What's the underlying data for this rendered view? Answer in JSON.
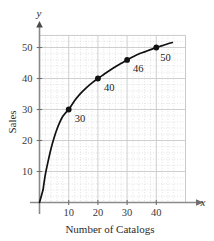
{
  "chart_data": {
    "type": "line",
    "title": "",
    "xlabel": "Number of Catalogs",
    "ylabel": "Sales",
    "x_axis_symbol": "x",
    "y_axis_symbol": "y",
    "xlim": [
      0,
      46
    ],
    "ylim": [
      0,
      54
    ],
    "xticks": [
      10,
      20,
      30,
      40
    ],
    "yticks": [
      10,
      20,
      30,
      40,
      50
    ],
    "xtick_labels": [
      "10",
      "20",
      "30",
      "40"
    ],
    "ytick_labels": [
      "10",
      "20",
      "30",
      "40",
      "50"
    ],
    "grid": true,
    "grid_major": true,
    "grid_minor": true,
    "minor_divisions": 5,
    "legend": "none",
    "series": [
      {
        "name": "Sales",
        "x": [
          10,
          20,
          30,
          40
        ],
        "y": [
          30,
          40,
          46,
          50
        ],
        "point_labels": [
          "30",
          "40",
          "46",
          "50"
        ],
        "marker": "filled-circle",
        "line_color": "#111111"
      }
    ],
    "curve_points": [
      {
        "x": 1.2,
        "y": 4.0
      },
      {
        "x": 2.0,
        "y": 9.0
      },
      {
        "x": 3.0,
        "y": 13.5
      },
      {
        "x": 4.0,
        "y": 17.6
      },
      {
        "x": 5.0,
        "y": 20.9
      },
      {
        "x": 6.0,
        "y": 23.7
      },
      {
        "x": 7.0,
        "y": 26.0
      },
      {
        "x": 8.0,
        "y": 27.8
      },
      {
        "x": 9.0,
        "y": 29.0
      },
      {
        "x": 10.0,
        "y": 30.0
      },
      {
        "x": 12.0,
        "y": 32.8
      },
      {
        "x": 14.0,
        "y": 35.1
      },
      {
        "x": 16.0,
        "y": 37.0
      },
      {
        "x": 18.0,
        "y": 38.6
      },
      {
        "x": 20.0,
        "y": 40.0
      },
      {
        "x": 22.0,
        "y": 41.3
      },
      {
        "x": 24.0,
        "y": 42.6
      },
      {
        "x": 26.0,
        "y": 43.8
      },
      {
        "x": 28.0,
        "y": 44.9
      },
      {
        "x": 30.0,
        "y": 46.0
      },
      {
        "x": 32.0,
        "y": 47.0
      },
      {
        "x": 34.0,
        "y": 47.9
      },
      {
        "x": 36.0,
        "y": 48.6
      },
      {
        "x": 38.0,
        "y": 49.3
      },
      {
        "x": 40.0,
        "y": 50.0
      },
      {
        "x": 42.0,
        "y": 50.6
      },
      {
        "x": 44.0,
        "y": 51.2
      },
      {
        "x": 45.5,
        "y": 51.6
      }
    ],
    "colors": {
      "curve": "#111111",
      "marker": "#111111",
      "axis": "#8a8a8a",
      "grid_major": "#c9c9c9",
      "grid_minor": "#cfcfcf",
      "text": "#2b2b2b",
      "background": "#ffffff"
    }
  }
}
